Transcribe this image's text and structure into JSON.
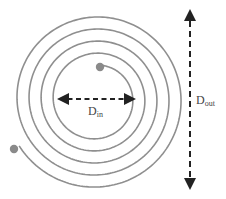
{
  "diagram": {
    "type": "spiral-coil",
    "turns": 5,
    "colors": {
      "coil": "#8a8a8a",
      "dot": "#8a8a8a",
      "arrow": "#222222",
      "text": "#444444",
      "background": "#ffffff"
    },
    "labels": {
      "inner_diameter": {
        "main": "D",
        "sub": "in"
      },
      "outer_diameter": {
        "main": "D",
        "sub": "out"
      }
    }
  }
}
